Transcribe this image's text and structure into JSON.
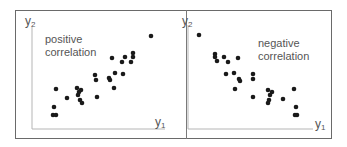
{
  "panels": [
    {
      "id": "positive",
      "label_line1": "positive",
      "label_line2": "correlation",
      "y_axis_label": "y",
      "y_axis_sub": "2",
      "x_axis_label": "y",
      "x_axis_sub": "1"
    },
    {
      "id": "negative",
      "label_line1": "negative",
      "label_line2": "correlation",
      "y_axis_label": "y",
      "y_axis_sub": "2",
      "x_axis_label": "y",
      "x_axis_sub": "1"
    }
  ],
  "colors": {
    "point": "#1a1a1a",
    "axis": "#b5b5b5",
    "frame": "#6a6a6a",
    "text": "#555555"
  },
  "chart_data": [
    {
      "type": "scatter",
      "title": "positive correlation",
      "xlabel": "y1",
      "ylabel": "y2",
      "points_px": [
        [
          151,
          36
        ],
        [
          133,
          53
        ],
        [
          133,
          57
        ],
        [
          131,
          62
        ],
        [
          125,
          57
        ],
        [
          122,
          62
        ],
        [
          112,
          58
        ],
        [
          115,
          73
        ],
        [
          123,
          74
        ],
        [
          109,
          78
        ],
        [
          110,
          80
        ],
        [
          95,
          75
        ],
        [
          96,
          80
        ],
        [
          114,
          88
        ],
        [
          97,
          97
        ],
        [
          67,
          98
        ],
        [
          77,
          88
        ],
        [
          79,
          92
        ],
        [
          78,
          95
        ],
        [
          80,
          100
        ],
        [
          82,
          103
        ],
        [
          81,
          90
        ],
        [
          56,
          89
        ],
        [
          54,
          107
        ],
        [
          53,
          115
        ],
        [
          56,
          115
        ]
      ]
    },
    {
      "type": "scatter",
      "title": "negative correlation",
      "xlabel": "y1",
      "ylabel": "y2",
      "points_px": [
        [
          199,
          35
        ],
        [
          215,
          54
        ],
        [
          215,
          57
        ],
        [
          217,
          61
        ],
        [
          224,
          57
        ],
        [
          228,
          62
        ],
        [
          238,
          58
        ],
        [
          226,
          74
        ],
        [
          234,
          73
        ],
        [
          239,
          79
        ],
        [
          240,
          81
        ],
        [
          235,
          89
        ],
        [
          253,
          74
        ],
        [
          253,
          79
        ],
        [
          253,
          97
        ],
        [
          268,
          90
        ],
        [
          272,
          92
        ],
        [
          270,
          95
        ],
        [
          269,
          100
        ],
        [
          268,
          103
        ],
        [
          283,
          99
        ],
        [
          294,
          89
        ],
        [
          296,
          107
        ],
        [
          297,
          115
        ],
        [
          295,
          115
        ]
      ]
    }
  ]
}
